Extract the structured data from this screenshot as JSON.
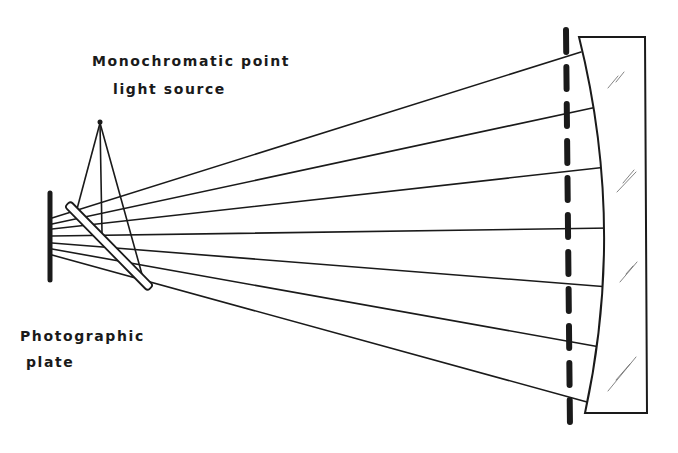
{
  "diagram": {
    "labels": {
      "source_line1": "Monochromatic point",
      "source_line2": "light source",
      "plate_line1": "Photographic",
      "plate_line2": "plate"
    },
    "components": [
      "photographic-plate",
      "beam-splitter",
      "point-light-source",
      "aperture-stop",
      "concave-mirror"
    ],
    "rays_count": 7,
    "colors": {
      "ink": "#1a1a1a",
      "background": "#ffffff"
    }
  }
}
